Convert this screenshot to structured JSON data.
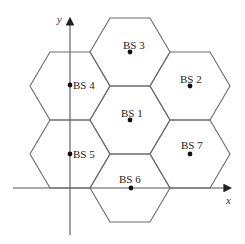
{
  "diagram": {
    "type": "hexagonal cellular layout",
    "axes": {
      "x_label": "x",
      "y_label": "y"
    },
    "stations": [
      {
        "id": "bs1",
        "label": "BS 1"
      },
      {
        "id": "bs2",
        "label": "BS 2"
      },
      {
        "id": "bs3",
        "label": "BS 3"
      },
      {
        "id": "bs4",
        "label": "BS 4"
      },
      {
        "id": "bs5",
        "label": "BS 5"
      },
      {
        "id": "bs6",
        "label": "BS 6"
      },
      {
        "id": "bs7",
        "label": "BS 7"
      }
    ],
    "colors": {
      "hex_stroke": "#6b6b6b",
      "axis": "#555555",
      "dot": "#111111"
    }
  }
}
